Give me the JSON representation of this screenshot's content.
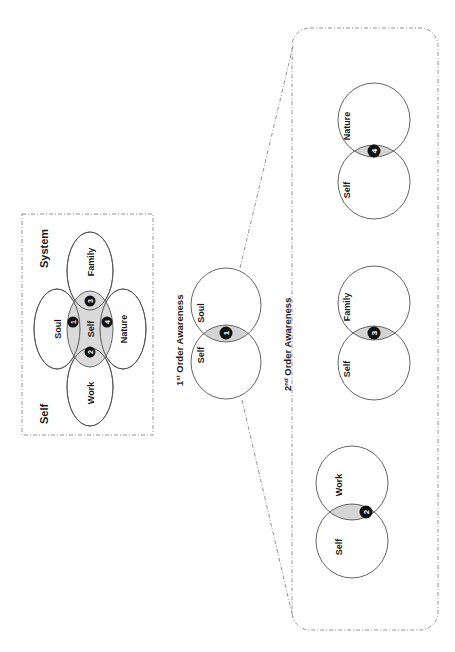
{
  "left_panel": {
    "title_self": "Self",
    "title_system": "System",
    "center_label": "Self",
    "petals": [
      {
        "label": "Soul",
        "number": "1"
      },
      {
        "label": "Work",
        "number": "2"
      },
      {
        "label": "Family",
        "number": "3"
      },
      {
        "label": "Nature",
        "number": "4"
      }
    ]
  },
  "first_order": {
    "title_prefix": "1",
    "title_sup": "st",
    "title_rest": " Order Awareness",
    "left_label": "Self",
    "right_label": "Soul",
    "number": "1"
  },
  "second_order": {
    "title_prefix": "2",
    "title_sup": "nd",
    "title_rest": " Order Awareness",
    "pairs": [
      {
        "left_label": "Self",
        "right_label": "Work",
        "number": "2"
      },
      {
        "left_label": "Self",
        "right_label": "Family",
        "number": "3"
      },
      {
        "left_label": "Self",
        "right_label": "Nature",
        "number": "4"
      }
    ]
  },
  "colors": {
    "overlap_fill": "#d4d4d4",
    "badge_fill": "#111111",
    "stroke": "#555555"
  }
}
